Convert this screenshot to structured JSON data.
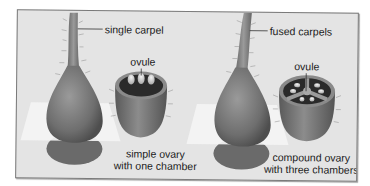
{
  "figure": {
    "left": {
      "carpel_label": "single carpel",
      "ovule_label": "ovule",
      "caption_line1": "simple ovary",
      "caption_line2": "with one chamber"
    },
    "right": {
      "carpel_label": "fused carpels",
      "ovule_label": "ovule",
      "caption_line1": "compound ovary",
      "caption_line2": "with three chambers"
    }
  },
  "colors": {
    "panel_bg": "#e4e4e4",
    "pistil": "#777777",
    "chamber_dark": "#2a2a2a",
    "ovule": "#dcdcdc",
    "plane": "#f4f4f4"
  }
}
